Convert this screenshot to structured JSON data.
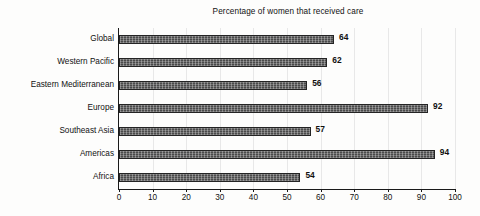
{
  "chart_data": {
    "type": "bar",
    "orientation": "horizontal",
    "title": "Percentage of women that received care",
    "xlabel": "",
    "ylabel": "",
    "categories": [
      "Global",
      "Western Pacific",
      "Eastern Mediterranean",
      "Europe",
      "Southeast Asia",
      "Americas",
      "Africa"
    ],
    "values": [
      64,
      62,
      56,
      92,
      57,
      94,
      54
    ],
    "value_labels": [
      "64",
      "62",
      "56",
      "92",
      "57",
      "94",
      "54"
    ],
    "xlim": [
      0,
      100
    ],
    "xticks": [
      0,
      10,
      20,
      30,
      40,
      50,
      60,
      70,
      80,
      90,
      100
    ],
    "xtick_labels": [
      "0",
      "10",
      "20",
      "30",
      "40",
      "50",
      "60",
      "70",
      "80",
      "90",
      "100"
    ],
    "grid": "vertical",
    "legend": "none",
    "bar_color": "#4a4a4a",
    "bar_edge_color": "#242424",
    "gridline_color": "#e8e8e8",
    "axis_color": "#1a1a1a",
    "text_color": "#111111"
  }
}
